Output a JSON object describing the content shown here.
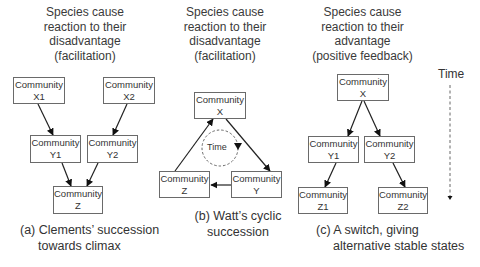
{
  "panels": [
    {
      "id": "a",
      "heading": [
        "Species cause",
        "reaction to their",
        "disadvantage",
        "(facilitation)"
      ],
      "caption": [
        "(a) Clements’ succession",
        "towards climax"
      ],
      "boxes": [
        {
          "id": "X1",
          "line1": "Community",
          "line2": "X1"
        },
        {
          "id": "X2",
          "line1": "Community",
          "line2": "X2"
        },
        {
          "id": "Y1",
          "line1": "Community",
          "line2": "Y1"
        },
        {
          "id": "Y2",
          "line1": "Community",
          "line2": "Y2"
        },
        {
          "id": "Z",
          "line1": "Community",
          "line2": "Z"
        }
      ],
      "edges": [
        [
          "X1",
          "Y1"
        ],
        [
          "X2",
          "Y2"
        ],
        [
          "Y1",
          "Z"
        ],
        [
          "Y2",
          "Z"
        ]
      ]
    },
    {
      "id": "b",
      "heading": [
        "Species cause",
        "reaction to their",
        "disadvantage",
        "(facilitation)"
      ],
      "caption": [
        "(b) Watt’s cyclic",
        "succession"
      ],
      "boxes": [
        {
          "id": "X",
          "line1": "Community",
          "line2": "X"
        },
        {
          "id": "Y",
          "line1": "Community",
          "line2": "Y"
        },
        {
          "id": "Z",
          "line1": "Community",
          "line2": "Z"
        }
      ],
      "edges": [
        [
          "X",
          "Y"
        ],
        [
          "Y",
          "Z"
        ],
        [
          "Z",
          "X"
        ]
      ],
      "cycle_label": "Time"
    },
    {
      "id": "c",
      "heading": [
        "Species cause",
        "reaction to their",
        "advantage",
        "(positive feedback)"
      ],
      "caption": [
        "(c) A switch, giving",
        "alternative stable states"
      ],
      "boxes": [
        {
          "id": "X",
          "line1": "Community",
          "line2": "X"
        },
        {
          "id": "Y1",
          "line1": "Community",
          "line2": "Y1"
        },
        {
          "id": "Y2",
          "line1": "Community",
          "line2": "Y2"
        },
        {
          "id": "Z1",
          "line1": "Community",
          "line2": "Z1"
        },
        {
          "id": "Z2",
          "line1": "Community",
          "line2": "Z2"
        }
      ],
      "edges": [
        [
          "X",
          "Y1"
        ],
        [
          "X",
          "Y2"
        ],
        [
          "Y1",
          "Z1"
        ],
        [
          "Y2",
          "Z2"
        ]
      ]
    }
  ],
  "time_axis": {
    "label": "Time",
    "direction": "down"
  },
  "colors": {
    "line": "#222222",
    "box_border": "#6a6a6a",
    "text": "#333333",
    "dashed": "#555555"
  }
}
